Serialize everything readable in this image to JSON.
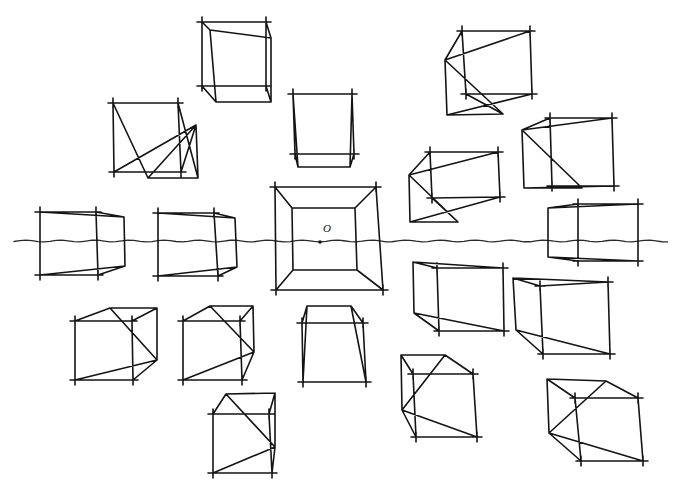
{
  "diagram": {
    "type": "one-point perspective sketch",
    "ink_color": "#141414",
    "background": "#ffffff",
    "horizon": {
      "y": 241,
      "x_start": 14,
      "x_end": 672
    },
    "vanishing_point": {
      "x": 320,
      "y": 242,
      "label": "O",
      "label_x": 323,
      "label_y": 226
    },
    "cubes": [
      {
        "id": "top-center-left",
        "front": [
          [
            202,
            22
          ],
          [
            266,
            22
          ],
          [
            266,
            86
          ],
          [
            202,
            86
          ]
        ],
        "back": [
          [
            210,
            30
          ],
          [
            271,
            38
          ],
          [
            271,
            102
          ],
          [
            216,
            102
          ]
        ]
      },
      {
        "id": "upper-left",
        "front": [
          [
            113,
            103
          ],
          [
            178,
            103
          ],
          [
            181,
            172
          ],
          [
            114,
            172
          ]
        ],
        "back": [
          [
            148,
            178
          ],
          [
            198,
            178
          ],
          [
            196,
            125
          ],
          [
            196,
            125
          ]
        ]
      },
      {
        "id": "upper-center",
        "front": [
          [
            293,
            94
          ],
          [
            352,
            94
          ],
          [
            354,
            154
          ],
          [
            295,
            154
          ]
        ],
        "back": [
          [
            298,
            167
          ],
          [
            350,
            167
          ],
          [
            350,
            167
          ],
          [
            298,
            167
          ]
        ]
      },
      {
        "id": "top-right",
        "front": [
          [
            462,
            31
          ],
          [
            530,
            31
          ],
          [
            532,
            94
          ],
          [
            466,
            94
          ]
        ],
        "back": [
          [
            445,
            60
          ],
          [
            445,
            60
          ],
          [
            447,
            115
          ],
          [
            503,
            114
          ]
        ]
      },
      {
        "id": "mid-right-upper",
        "front": [
          [
            430,
            152
          ],
          [
            498,
            152
          ],
          [
            500,
            197
          ],
          [
            432,
            198
          ]
        ],
        "back": [
          [
            409,
            175
          ],
          [
            409,
            175
          ],
          [
            410,
            222
          ],
          [
            458,
            222
          ]
        ]
      },
      {
        "id": "far-right-upper",
        "front": [
          [
            550,
            118
          ],
          [
            612,
            118
          ],
          [
            614,
            186
          ],
          [
            552,
            186
          ]
        ],
        "back": [
          [
            522,
            130
          ],
          [
            522,
            130
          ],
          [
            524,
            188
          ],
          [
            582,
            188
          ]
        ]
      },
      {
        "id": "left-horizon",
        "front": [
          [
            40,
            212
          ],
          [
            96,
            212
          ],
          [
            98,
            275
          ],
          [
            40,
            275
          ]
        ],
        "back": [
          [
            124,
            217
          ],
          [
            124,
            217
          ],
          [
            125,
            266
          ],
          [
            125,
            266
          ]
        ]
      },
      {
        "id": "left-center-horizon",
        "front": [
          [
            158,
            213
          ],
          [
            214,
            213
          ],
          [
            218,
            276
          ],
          [
            158,
            276
          ]
        ],
        "back": [
          [
            235,
            218
          ],
          [
            235,
            218
          ],
          [
            237,
            267
          ],
          [
            237,
            267
          ]
        ]
      },
      {
        "id": "center-frame",
        "front": [
          [
            275,
            187
          ],
          [
            376,
            187
          ],
          [
            383,
            290
          ],
          [
            276,
            290
          ]
        ],
        "back": [
          [
            292,
            208
          ],
          [
            355,
            208
          ],
          [
            357,
            270
          ],
          [
            293,
            270
          ]
        ]
      },
      {
        "id": "right-horizon",
        "front": [
          [
            578,
            204
          ],
          [
            638,
            204
          ],
          [
            638,
            261
          ],
          [
            578,
            261
          ]
        ],
        "back": [
          [
            548,
            208
          ],
          [
            548,
            208
          ],
          [
            548,
            257
          ],
          [
            548,
            257
          ]
        ]
      },
      {
        "id": "right-below-a",
        "front": [
          [
            437,
            268
          ],
          [
            503,
            268
          ],
          [
            504,
            331
          ],
          [
            439,
            331
          ]
        ],
        "back": [
          [
            413,
            262
          ],
          [
            413,
            262
          ],
          [
            414,
            313
          ],
          [
            414,
            313
          ]
        ]
      },
      {
        "id": "right-below-b",
        "front": [
          [
            540,
            286
          ],
          [
            608,
            282
          ],
          [
            610,
            354
          ],
          [
            543,
            354
          ]
        ],
        "back": [
          [
            513,
            278
          ],
          [
            513,
            278
          ],
          [
            516,
            330
          ],
          [
            516,
            330
          ]
        ]
      },
      {
        "id": "lower-left",
        "front": [
          [
            75,
            321
          ],
          [
            132,
            321
          ],
          [
            133,
            380
          ],
          [
            75,
            380
          ]
        ],
        "back": [
          [
            110,
            308
          ],
          [
            157,
            308
          ],
          [
            157,
            360
          ],
          [
            157,
            360
          ]
        ]
      },
      {
        "id": "lower-left-center",
        "front": [
          [
            183,
            321
          ],
          [
            240,
            321
          ],
          [
            242,
            380
          ],
          [
            183,
            380
          ]
        ],
        "back": [
          [
            210,
            306
          ],
          [
            253,
            306
          ],
          [
            254,
            352
          ],
          [
            254,
            352
          ]
        ]
      },
      {
        "id": "lower-center",
        "front": [
          [
            302,
            323
          ],
          [
            363,
            323
          ],
          [
            366,
            382
          ],
          [
            303,
            382
          ]
        ],
        "back": [
          [
            307,
            306
          ],
          [
            351,
            306
          ],
          [
            351,
            306
          ],
          [
            307,
            306
          ]
        ]
      },
      {
        "id": "bottom-center",
        "front": [
          [
            213,
            414
          ],
          [
            269,
            414
          ],
          [
            272,
            473
          ],
          [
            213,
            473
          ]
        ],
        "back": [
          [
            226,
            394
          ],
          [
            275,
            393
          ],
          [
            275,
            447
          ],
          [
            275,
            447
          ]
        ]
      },
      {
        "id": "bottom-right-a",
        "front": [
          [
            413,
            374
          ],
          [
            473,
            374
          ],
          [
            477,
            437
          ],
          [
            416,
            437
          ]
        ],
        "back": [
          [
            401,
            355
          ],
          [
            445,
            355
          ],
          [
            402,
            410
          ],
          [
            402,
            410
          ]
        ]
      },
      {
        "id": "bottom-right-b",
        "front": [
          [
            575,
            398
          ],
          [
            638,
            398
          ],
          [
            643,
            461
          ],
          [
            581,
            461
          ]
        ],
        "back": [
          [
            547,
            379
          ],
          [
            606,
            381
          ],
          [
            549,
            433
          ],
          [
            549,
            433
          ]
        ]
      }
    ]
  }
}
